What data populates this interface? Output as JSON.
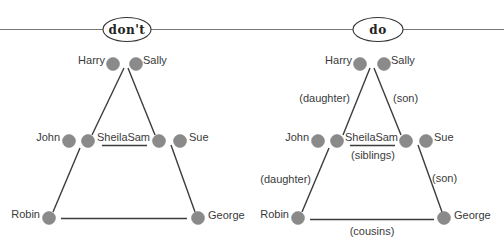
{
  "panels": [
    {
      "id": "dont",
      "title": "don't",
      "nodes": {
        "harry": "Harry",
        "sally": "Sally",
        "john": "John",
        "sheila": "Sheila",
        "sam": "Sam",
        "sue": "Sue",
        "robin": "Robin",
        "george": "George"
      },
      "edge_labels": {}
    },
    {
      "id": "do",
      "title": "do",
      "nodes": {
        "harry": "Harry",
        "sally": "Sally",
        "john": "John",
        "sheila": "Sheila",
        "sam": "Sam",
        "sue": "Sue",
        "robin": "Robin",
        "george": "George"
      },
      "edge_labels": {
        "harry_sheila": "(daughter)",
        "sally_sam": "(son)",
        "sheila_sam": "(siblings)",
        "sheila_robin": "(daughter)",
        "sam_george": "(son)",
        "robin_george": "(cousins)"
      }
    }
  ]
}
